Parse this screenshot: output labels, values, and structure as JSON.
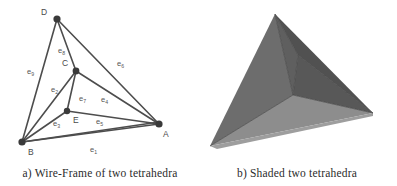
{
  "figure": {
    "panels": [
      {
        "id": "wireframe",
        "caption": "a) Wire-Frame of two tetrahedra",
        "vertices": [
          {
            "name": "D",
            "label": "D",
            "x": 57,
            "y": 19,
            "lx": 41,
            "ly": 15
          },
          {
            "name": "C",
            "label": "C",
            "x": 76,
            "y": 71,
            "lx": 62,
            "ly": 66
          },
          {
            "name": "B",
            "label": "B",
            "x": 22,
            "y": 142,
            "lx": 28,
            "ly": 155
          },
          {
            "name": "E",
            "label": "E",
            "x": 67,
            "y": 111,
            "lx": 73,
            "ly": 123
          },
          {
            "name": "A",
            "label": "A",
            "x": 159,
            "y": 124,
            "lx": 163,
            "ly": 137
          }
        ],
        "edges": [
          {
            "name": "e1",
            "from": "B",
            "to": "A",
            "letter": "e",
            "sub": "1",
            "lx": 90,
            "ly": 152
          },
          {
            "name": "e2",
            "from": "B",
            "to": "C",
            "letter": "e",
            "sub": "2",
            "lx": 51,
            "ly": 92
          },
          {
            "name": "e3",
            "from": "B",
            "to": "E",
            "letter": "e",
            "sub": "3",
            "lx": 53,
            "ly": 126
          },
          {
            "name": "e4",
            "from": "C",
            "to": "A",
            "letter": "e",
            "sub": "4",
            "lx": 101,
            "ly": 102
          },
          {
            "name": "e5",
            "from": "E",
            "to": "A",
            "letter": "e",
            "sub": "5",
            "lx": 96,
            "ly": 124
          },
          {
            "name": "e6",
            "from": "D",
            "to": "A",
            "letter": "e",
            "sub": "6",
            "lx": 117,
            "ly": 66
          },
          {
            "name": "e7",
            "from": "C",
            "to": "E",
            "letter": "e",
            "sub": "7",
            "lx": 79,
            "ly": 101
          },
          {
            "name": "e8",
            "from": "D",
            "to": "C",
            "letter": "e",
            "sub": "8",
            "lx": 58,
            "ly": 53
          },
          {
            "name": "e9",
            "from": "D",
            "to": "B",
            "letter": "e",
            "sub": "9",
            "lx": 27,
            "ly": 74
          }
        ],
        "extra_edges": [
          {
            "name": "edge-B-A-upper",
            "from": "B",
            "to": "A"
          }
        ],
        "colors": {
          "line": "#4d4d4d",
          "vertex": "#3a3a3a",
          "label": "#555555"
        }
      },
      {
        "id": "shaded",
        "caption": "b) Shaded two tetrahedra",
        "colors": {
          "face_left_outer": "#6e6e6e",
          "face_left_inner": "#616161",
          "face_top_right": "#525252",
          "face_right_outer": "#595959",
          "face_bottom": "#8e8e8e",
          "face_bottom_light": "#a0a0a0",
          "face_crease": "#4a4a4a",
          "background": "#ffffff"
        }
      }
    ]
  }
}
